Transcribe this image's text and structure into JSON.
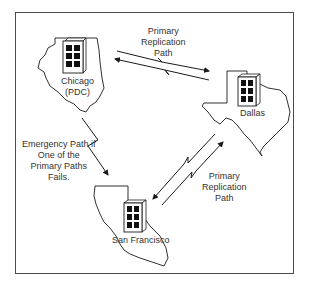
{
  "diagram": {
    "type": "network-replication-map",
    "sites": [
      {
        "id": "chicago",
        "label_line1": "Chicago",
        "label_line2": "(PDC)",
        "state_shape": "illinois"
      },
      {
        "id": "dallas",
        "label_line1": "Dallas",
        "state_shape": "texas"
      },
      {
        "id": "san_francisco",
        "label_line1": "San Francisco",
        "state_shape": "california"
      }
    ],
    "links": [
      {
        "from": "chicago",
        "to": "dallas",
        "type": "primary",
        "bidirectional": true,
        "label": [
          "Primary",
          "Replication",
          "Path"
        ]
      },
      {
        "from": "dallas",
        "to": "san_francisco",
        "type": "primary",
        "bidirectional": true,
        "label": [
          "Primary",
          "Replication",
          "Path"
        ]
      },
      {
        "from": "chicago",
        "to": "san_francisco",
        "type": "emergency",
        "bidirectional": false,
        "label": [
          "Emergency Path if",
          "One of the",
          "Primary Paths",
          "Fails."
        ]
      }
    ],
    "colors": {
      "line": "#1a1a1a",
      "frame": "#4a4a4a",
      "text": "#333333",
      "window": "#111111"
    }
  }
}
